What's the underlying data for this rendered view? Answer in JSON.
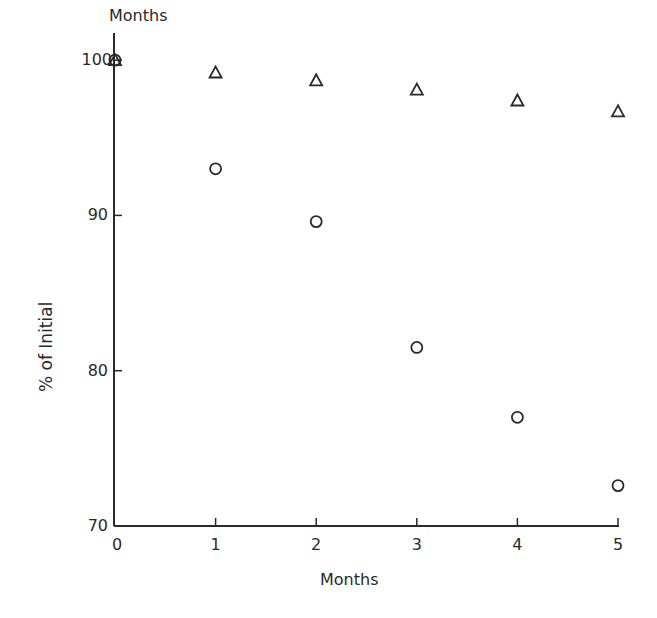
{
  "chart_data": {
    "type": "scatter",
    "title": "Months",
    "xlabel": "Months",
    "ylabel": "% of Initial",
    "xlim": [
      0,
      5
    ],
    "ylim": [
      70,
      100
    ],
    "x_ticks": [
      "0",
      "1",
      "2",
      "3",
      "4",
      "5"
    ],
    "y_ticks": [
      "70",
      "80",
      "90",
      "100"
    ],
    "grid": false,
    "legend": null,
    "x": [
      0,
      1,
      2,
      3,
      4,
      5
    ],
    "series": [
      {
        "name": "triangles",
        "marker": "triangle",
        "values": [
          100,
          99.2,
          98.7,
          98.1,
          97.4,
          96.7
        ]
      },
      {
        "name": "circles",
        "marker": "circle",
        "values": [
          100,
          93.0,
          89.6,
          81.5,
          77.0,
          72.6
        ]
      }
    ]
  },
  "colors": {
    "ink": "#2a2a2a",
    "background": "#ffffff"
  }
}
